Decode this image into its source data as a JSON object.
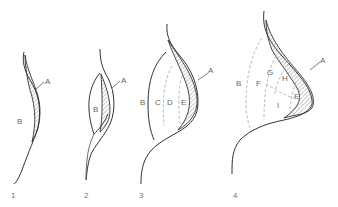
{
  "figure": {
    "stages": [
      {
        "number": "1",
        "labels": {
          "A": "A",
          "B": "B"
        }
      },
      {
        "number": "2",
        "labels": {
          "A": "A",
          "B": "B"
        }
      },
      {
        "number": "3",
        "labels": {
          "A": "A",
          "B": "B",
          "C": "C",
          "D": "D",
          "E": "E"
        }
      },
      {
        "number": "4",
        "labels": {
          "A": "A",
          "B": "B",
          "E": "E",
          "F": "F",
          "G": "G",
          "H": "H",
          "I": "I"
        }
      }
    ]
  },
  "colors": {
    "line": "#333333",
    "dashed": "#aaaaaa",
    "label": "#666666"
  }
}
